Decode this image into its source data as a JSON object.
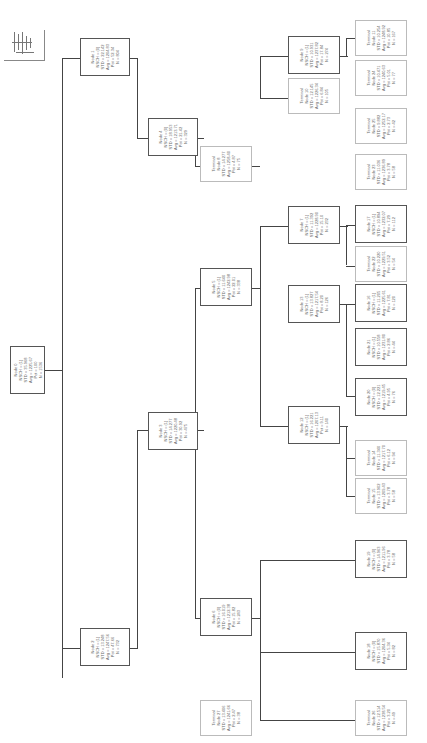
{
  "diagram": {
    "type": "regression-tree",
    "orientation": "rotated-90",
    "nodes": [
      {
        "id": "n0",
        "lines": [
          "Node 0",
          "NSCH = (1)",
          "STD = 35.968",
          "Avg = 1225.67",
          "Pct = 100",
          "N = 1536"
        ]
      },
      {
        "id": "n1",
        "lines": [
          "Node 1",
          "NSCH = (0)",
          "STD = 22.142",
          "Avg = 1204.83",
          "Pct = 52.34",
          "N = 804"
        ]
      },
      {
        "id": "n2",
        "lines": [
          "Node 2",
          "NSCH = (1)",
          "STD = 13.248",
          "Avg = 1247.56",
          "Pct = 47.66",
          "N = 732"
        ]
      },
      {
        "id": "n3",
        "lines": [
          "Node 3",
          "NSCH = (1)",
          "STD = 14.277",
          "Avg = 1220.48",
          "Pct = 30.92",
          "N = 475"
        ]
      },
      {
        "id": "n4",
        "lines": [
          "Node 4",
          "NSCH = (0)",
          "STD = 18.953",
          "Avg = 1213.71",
          "Pct = 21.42",
          "N = 329"
        ]
      },
      {
        "id": "n5",
        "lines": [
          "Node 5",
          "NSCH = (1)",
          "STD = 11.640",
          "Avg = 1242.98",
          "Pct = 22.01",
          "N = 338"
        ]
      },
      {
        "id": "n6",
        "lines": [
          "Node 6",
          "NSCH = (0)",
          "STD = 16.019",
          "Avg = 1212.38",
          "Pct = 15.82",
          "N = 243"
        ]
      },
      {
        "id": "n7",
        "lines": [
          "Node 7",
          "NSCH = (1)",
          "STD = 11.392",
          "Avg = 1228.90",
          "Pct = 15.10",
          "N = 232"
        ]
      },
      {
        "id": "n8",
        "lines": [
          "Terminal",
          "Node 8",
          "STD = 14.277",
          "Avg = 1258.40",
          "Pct = 4.87",
          "N = 75"
        ]
      },
      {
        "id": "n9",
        "lines": [
          "Node 9",
          "NSCH = (1)",
          "STD = 10.931",
          "Avg = 1237.82",
          "Pct = 17.84",
          "N = 274"
        ]
      },
      {
        "id": "n10",
        "lines": [
          "Terminal",
          "Node 10",
          "STD = 12.145",
          "Avg = 1226.34",
          "Pct = 6.84",
          "N = 105"
        ]
      },
      {
        "id": "n11",
        "lines": [
          "Terminal",
          "Node 11",
          "STD = 10.254",
          "Avg = 1248.92",
          "Pct = 10.85",
          "N = 167"
        ]
      },
      {
        "id": "n12",
        "lines": [
          "Node 12",
          "NSCH = (1)",
          "STD = 16.221",
          "Avg = 1207.13",
          "Pct = 9.11",
          "N = 140"
        ]
      },
      {
        "id": "n13",
        "lines": [
          "Node 13",
          "NSCH = (1)",
          "STD = 13.827",
          "Avg = 1217.54",
          "Pct = 8.20",
          "N = 126"
        ]
      },
      {
        "id": "n14",
        "lines": [
          "Terminal",
          "Node 14",
          "STD = 11.340",
          "Avg = 1217.70",
          "Pct = 6.12",
          "N = 94"
        ]
      },
      {
        "id": "n15",
        "lines": [
          "Terminal",
          "Node 15",
          "STD = 13.902",
          "Avg = 1209.43",
          "Pct = 3.78",
          "N = 58"
        ]
      },
      {
        "id": "n16",
        "lines": [
          "Node 16",
          "NSCH = (1)",
          "STD = 11.205",
          "Avg = 1225.61",
          "Pct = 7.81",
          "N = 120"
        ]
      },
      {
        "id": "n17",
        "lines": [
          "Node 17",
          "NSCH = (1)",
          "STD = 10.894",
          "Avg = 1232.07",
          "Pct = 7.29",
          "N = 112"
        ]
      },
      {
        "id": "n18",
        "lines": [
          "Node 18",
          "NSCH = (0)",
          "STD = 15.870",
          "Avg = 1204.36",
          "Pct = 5.34",
          "N = 82"
        ]
      },
      {
        "id": "n19",
        "lines": [
          "Node 19",
          "NSCH = (0)",
          "STD = 14.963",
          "Avg = 1211.96",
          "Pct = 3.78",
          "N = 58"
        ]
      },
      {
        "id": "n20",
        "lines": [
          "Node 20",
          "NSCH = (0)",
          "STD = 12.221",
          "Avg = 1219.45",
          "Pct = 4.95",
          "N = 76"
        ]
      },
      {
        "id": "n21",
        "lines": [
          "Node 21",
          "NSCH = (1)",
          "STD = 10.558",
          "Avg = 1231.80",
          "Pct = 2.86",
          "N = 44"
        ]
      },
      {
        "id": "n22",
        "lines": [
          "Terminal",
          "Node 22",
          "STD = 10.220",
          "Avg = 1229.51",
          "Pct = 3.52",
          "N = 54"
        ]
      },
      {
        "id": "n23",
        "lines": [
          "Terminal",
          "Node 23",
          "STD = 11.036",
          "Avg = 1236.89",
          "Pct = 3.78",
          "N = 58"
        ]
      },
      {
        "id": "n24",
        "lines": [
          "Terminal",
          "Node 24",
          "STD = 10.471",
          "Avg = 1240.63",
          "Pct = 5.01",
          "N = 77"
        ]
      },
      {
        "id": "n25",
        "lines": [
          "Terminal",
          "Node 25",
          "STD = 9.882",
          "Avg = 1252.17",
          "Pct = 2.73",
          "N = 42"
        ]
      },
      {
        "id": "n26",
        "lines": [
          "Terminal",
          "Node 26",
          "STD = 12.514",
          "Avg = 1238.54",
          "Pct = 3.20",
          "N = 49"
        ]
      },
      {
        "id": "n27",
        "lines": [
          "Terminal",
          "Node 27",
          "STD = 13.406",
          "Avg = 1241.66",
          "Pct = 2.47",
          "N = 38"
        ]
      }
    ],
    "edge_labels": {
      "left": "NSCH = (0)",
      "right": "NSCH = (1)"
    }
  }
}
